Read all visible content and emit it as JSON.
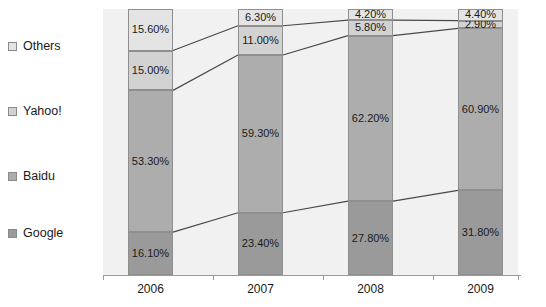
{
  "chart_data": {
    "type": "bar",
    "subtype": "100% stacked bar with connector lines",
    "title": "",
    "xlabel": "",
    "ylabel": "",
    "ylim": [
      0,
      100
    ],
    "grid": false,
    "legend_position": "left",
    "categories": [
      "2006",
      "2007",
      "2008",
      "2009"
    ],
    "series": [
      {
        "name": "Google",
        "color": "#9a9a9a",
        "values": [
          16.1,
          23.4,
          27.8,
          31.8
        ],
        "labels": [
          "16.10%",
          "23.40%",
          "27.80%",
          "31.80%"
        ]
      },
      {
        "name": "Baidu",
        "color": "#adadad",
        "values": [
          53.3,
          59.3,
          62.2,
          60.9
        ],
        "labels": [
          "53.30%",
          "59.30%",
          "62.20%",
          "60.90%"
        ]
      },
      {
        "name": "Yahoo!",
        "color": "#d2d2d2",
        "values": [
          15.0,
          11.0,
          5.8,
          2.9
        ],
        "labels": [
          "15.00%",
          "11.00%",
          "5.80%",
          "2.90%"
        ]
      },
      {
        "name": "Others",
        "color": "#e4e4e4",
        "values": [
          15.6,
          6.3,
          4.2,
          4.4
        ],
        "labels": [
          "15.60%",
          "6.30%",
          "4.20%",
          "4.40%"
        ]
      }
    ],
    "plot_background": "#f1f1f1",
    "connector_color": "#4a4a4a",
    "axis_color": "#9a9a9a"
  },
  "legend": {
    "items": [
      {
        "label": "Others",
        "color": "#e4e4e4"
      },
      {
        "label": "Yahoo!",
        "color": "#d2d2d2"
      },
      {
        "label": "Baidu",
        "color": "#adadad"
      },
      {
        "label": "Google",
        "color": "#9a9a9a"
      }
    ]
  },
  "axis": {
    "categories": [
      "2006",
      "2007",
      "2008",
      "2009"
    ]
  }
}
